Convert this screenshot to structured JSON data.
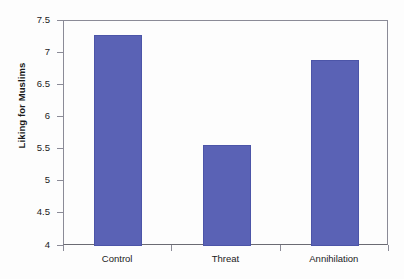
{
  "chart_data": {
    "type": "bar",
    "title": "",
    "xlabel": "",
    "ylabel": "Liking for Muslims",
    "categories": [
      "Control",
      "Threat",
      "Annihilation"
    ],
    "values": [
      7.29,
      5.57,
      6.89
    ],
    "series": [
      {
        "name": "Liking for Muslims",
        "values": [
          7.29,
          5.57,
          6.89
        ]
      }
    ],
    "ylim": [
      4,
      7.5
    ],
    "yticks": [
      4,
      4.5,
      5,
      5.5,
      6,
      6.5,
      7,
      7.5
    ],
    "ytick_labels": [
      "4",
      "4.5",
      "5",
      "5.5",
      "6",
      "6.5",
      "7",
      "7.5"
    ],
    "grid": false,
    "legend": false,
    "legend_position": "none",
    "bar_color": "#5a62b5",
    "axis_color": "#8b8b97",
    "background_color": "#fdfdfd",
    "text_color": "#1b1b1b"
  }
}
